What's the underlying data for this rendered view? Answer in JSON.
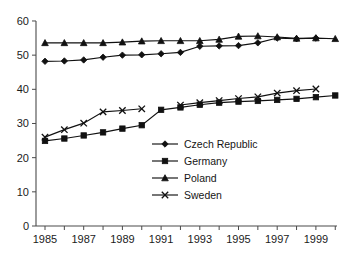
{
  "chart_data": {
    "type": "line",
    "title": "",
    "subtitle": "",
    "xlabel": "",
    "ylabel": "",
    "xlim": [
      1985,
      2000
    ],
    "ylim": [
      0,
      60
    ],
    "y_ticks": [
      0,
      10,
      20,
      30,
      40,
      50,
      60
    ],
    "x_ticks": [
      1985,
      1986,
      1987,
      1988,
      1989,
      1990,
      1991,
      1992,
      1993,
      1994,
      1995,
      1996,
      1997,
      1998,
      1999,
      2000
    ],
    "x_tick_labels": [
      "1985",
      "",
      "1987",
      "",
      "1989",
      "",
      "1991",
      "",
      "1993",
      "",
      "1995",
      "",
      "1997",
      "",
      "1999",
      ""
    ],
    "x": [
      1985,
      1986,
      1987,
      1988,
      1989,
      1990,
      1991,
      1992,
      1993,
      1994,
      1995,
      1996,
      1997,
      1998,
      1999,
      2000
    ],
    "grid": false,
    "legend_position": "center",
    "series": [
      {
        "name": "Czech Republic",
        "marker": "diamond",
        "values": [
          48.2,
          48.3,
          48.6,
          49.4,
          50.0,
          50.1,
          50.4,
          50.8,
          52.6,
          52.7,
          52.8,
          53.6,
          55.0,
          54.8,
          55.0,
          null
        ]
      },
      {
        "name": "Germany",
        "marker": "square",
        "values": [
          24.9,
          25.6,
          26.5,
          27.4,
          28.5,
          29.5,
          34.0,
          34.7,
          35.5,
          36.1,
          36.4,
          36.6,
          36.9,
          37.2,
          37.7,
          38.2
        ]
      },
      {
        "name": "Poland",
        "marker": "triangle",
        "values": [
          53.6,
          53.6,
          53.6,
          53.6,
          53.8,
          54.1,
          54.2,
          54.2,
          54.2,
          54.6,
          55.5,
          55.6,
          55.3,
          54.9,
          55.0,
          54.8
        ]
      },
      {
        "name": "Sweden",
        "marker": "cross",
        "values": [
          26.0,
          28.2,
          30.1,
          33.4,
          33.8,
          34.3,
          null,
          35.4,
          36.1,
          36.7,
          37.3,
          37.8,
          38.9,
          39.6,
          40.1,
          null
        ]
      }
    ]
  },
  "legend": {
    "entries": [
      {
        "label": "Czech Republic"
      },
      {
        "label": "Germany"
      },
      {
        "label": "Poland"
      },
      {
        "label": "Sweden"
      }
    ]
  }
}
